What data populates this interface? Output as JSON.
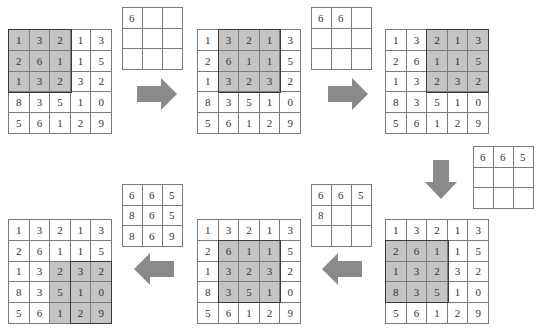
{
  "diagram": {
    "input_matrix": [
      [
        "1",
        "3",
        "2",
        "1",
        "3"
      ],
      [
        "2",
        "6",
        "1",
        "1",
        "5"
      ],
      [
        "1",
        "3",
        "2",
        "3",
        "2"
      ],
      [
        "8",
        "3",
        "5",
        "1",
        "0"
      ],
      [
        "5",
        "6",
        "1",
        "2",
        "9"
      ]
    ],
    "steps": [
      {
        "window_row": 0,
        "window_col": 0,
        "output": [
          [
            "6",
            "",
            ""
          ],
          [
            "",
            "",
            ""
          ],
          [
            "",
            "",
            ""
          ]
        ]
      },
      {
        "window_row": 0,
        "window_col": 1,
        "output": [
          [
            "6",
            "6",
            ""
          ],
          [
            "",
            "",
            ""
          ],
          [
            "",
            "",
            ""
          ]
        ]
      },
      {
        "window_row": 0,
        "window_col": 2,
        "output": [
          [
            "6",
            "6",
            "5"
          ],
          [
            "",
            "",
            ""
          ],
          [
            "",
            "",
            ""
          ]
        ]
      },
      {
        "window_row": 1,
        "window_col": 0,
        "output": [
          [
            "6",
            "6",
            "5"
          ],
          [
            "8",
            "",
            ""
          ],
          [
            "",
            "",
            ""
          ]
        ]
      },
      {
        "window_row": 1,
        "window_col": 1,
        "output": [
          [
            "6",
            "6",
            "5"
          ],
          [
            "8",
            "6",
            "5"
          ],
          [
            "8",
            "6",
            "9"
          ]
        ]
      },
      {
        "window_row": 2,
        "window_col": 2,
        "output": [
          [
            "6",
            "6",
            "5"
          ],
          [
            "8",
            "6",
            "5"
          ],
          [
            "8",
            "6",
            "9"
          ]
        ]
      }
    ],
    "arrows": [
      "right",
      "right",
      "down",
      "left",
      "left"
    ],
    "colors": {
      "highlight": "#c4c4c4",
      "arrow": "#8a8a8a",
      "border": "#7a7a7a",
      "window_border": "#3a3a3a"
    }
  }
}
